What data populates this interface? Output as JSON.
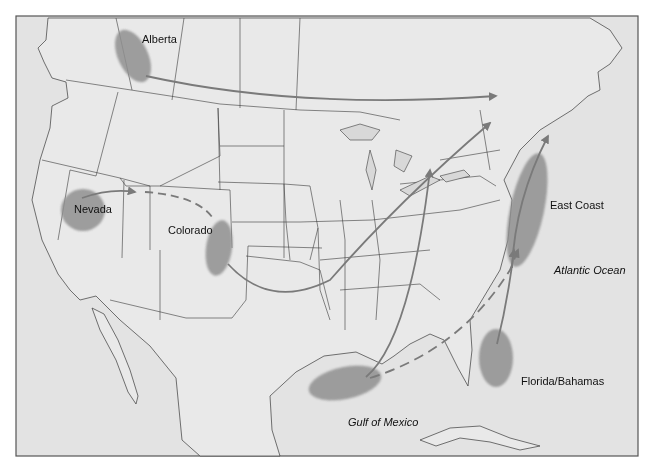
{
  "map": {
    "frame": {
      "x": 16,
      "y": 16,
      "w": 622,
      "h": 440
    },
    "colors": {
      "land": "#e6e6e6",
      "water": "#dedede",
      "border": "#3a3a3a",
      "region": "#8f8f8f",
      "arrow": "#7a7a7a",
      "frame": "#555555"
    },
    "regions": [
      {
        "id": "alberta",
        "label": "Alberta",
        "label_x": 142,
        "label_y": 43
      },
      {
        "id": "nevada",
        "label": "Nevada",
        "label_x": 74,
        "label_y": 213
      },
      {
        "id": "colorado",
        "label": "Colorado",
        "label_x": 168,
        "label_y": 234
      },
      {
        "id": "east-coast",
        "label": "East Coast",
        "label_x": 550,
        "label_y": 209
      },
      {
        "id": "florida-bahamas",
        "label": "Florida/Bahamas",
        "label_x": 521,
        "label_y": 385
      }
    ],
    "water_labels": [
      {
        "id": "atlantic-ocean",
        "label": "Atlantic Ocean",
        "label_x": 554,
        "label_y": 274
      },
      {
        "id": "gulf-of-mexico",
        "label": "Gulf of Mexico",
        "label_x": 348,
        "label_y": 426
      }
    ],
    "routes": [
      {
        "from": "Alberta",
        "to": "Atlantic Canada",
        "style": "solid"
      },
      {
        "from": "Nevada",
        "to": "Colorado",
        "style": "dashed"
      },
      {
        "from": "Colorado",
        "to": "Northeast",
        "style": "solid"
      },
      {
        "from": "Gulf of Mexico",
        "to": "Great Lakes",
        "style": "solid"
      },
      {
        "from": "Gulf of Mexico",
        "to": "East Coast",
        "style": "dashed"
      },
      {
        "from": "Florida/Bahamas",
        "to": "East Coast",
        "style": "solid"
      }
    ]
  }
}
